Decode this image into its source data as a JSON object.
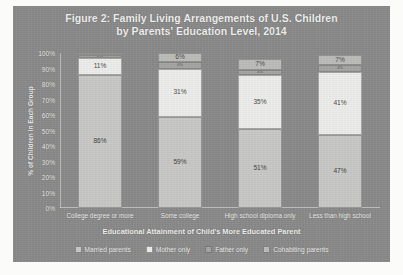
{
  "chart_data": {
    "type": "bar",
    "subtype": "stacked-100-percent",
    "title_line1": "Figure 2: Family Living Arrangements of U.S. Children",
    "title_line2": "by Parents' Education Level, 2014",
    "xlabel": "Educational Attainment of Child's More Educated Parent",
    "ylabel": "% of Children in Each Group",
    "ylim": [
      0,
      100
    ],
    "ytick_labels": [
      "0%",
      "10%",
      "20%",
      "30%",
      "40%",
      "50%",
      "60%",
      "70%",
      "80%",
      "90%",
      "100%"
    ],
    "ytick_values": [
      0,
      10,
      20,
      30,
      40,
      50,
      60,
      70,
      80,
      90,
      100
    ],
    "grid": false,
    "legend_position": "bottom",
    "categories": [
      "College degree or more",
      "Some college",
      "High school diploma only",
      "Less than high school"
    ],
    "series": [
      {
        "name": "Married parents",
        "color": "#c9c9c7",
        "values": [
          86,
          59,
          51,
          47
        ],
        "labels": [
          "86%",
          "59%",
          "51%",
          "47%"
        ]
      },
      {
        "name": "Mother only",
        "color": "#eeeeec",
        "values": [
          11,
          31,
          35,
          41
        ],
        "labels": [
          "11%",
          "31%",
          "35%",
          "41%"
        ]
      },
      {
        "name": "Father only",
        "color": "#a5a5a3",
        "values": [
          2,
          4,
          3,
          4
        ],
        "labels": [
          "2%",
          "4%",
          "3%",
          "4%"
        ]
      },
      {
        "name": "Cohabiting parents",
        "color": "#bdbdbb",
        "values": [
          1,
          6,
          7,
          7
        ],
        "labels": [
          "1%",
          "6%",
          "7%",
          "7%"
        ]
      }
    ]
  },
  "colors": {
    "panel_background": "#8a8a8a",
    "page_background": "#fbfbfa",
    "axis_text": "#f0efec"
  }
}
